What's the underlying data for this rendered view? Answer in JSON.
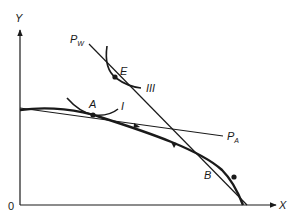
{
  "diagram": {
    "type": "economics-production-possibility-frontier",
    "axes": {
      "x_label": "X",
      "y_label": "Y",
      "origin_label": "0"
    },
    "curves": {
      "ppf": {
        "label": ""
      },
      "indifference_low": {
        "label": "I"
      },
      "indifference_high": {
        "label": "III"
      }
    },
    "lines": {
      "world_price": {
        "label_main": "P",
        "label_sub": "W"
      },
      "autarky_price": {
        "label_main": "P",
        "label_sub": "A"
      }
    },
    "points": {
      "A": "A",
      "B": "B",
      "E": "E"
    },
    "colors": {
      "ink": "#1a1a1a",
      "background": "#ffffff"
    }
  }
}
